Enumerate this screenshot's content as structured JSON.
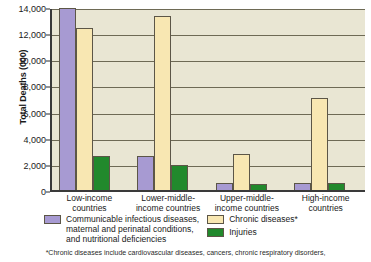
{
  "chart_data": {
    "type": "bar",
    "title": "",
    "xlabel": "",
    "ylabel": "Total Deaths (000)",
    "ylim": [
      0,
      14000
    ],
    "ytick_labels": [
      "14,000",
      "12,000",
      "10,000",
      "8,000",
      "6,000",
      "4,000",
      "2,000",
      "0"
    ],
    "ytick_values": [
      14000,
      12000,
      10000,
      8000,
      6000,
      4000,
      2000,
      0
    ],
    "grid": true,
    "legend_position": "bottom",
    "categories": [
      "Low-income\ncountries",
      "Lower-middle-\nincome countries",
      "Upper-middle-\nincome countries",
      "High-income\ncountries"
    ],
    "series": [
      {
        "name": "Communicable infectious diseases,\nmaternal and perinatal conditions,\nand nutritional deficiencies",
        "color": "#a79ad2",
        "values": [
          13900,
          2600,
          570,
          570
        ]
      },
      {
        "name": "Chronic diseases*",
        "color": "#f8e7b2",
        "values": [
          12400,
          13300,
          2750,
          7050
        ]
      },
      {
        "name": "Injuries",
        "color": "#21892c",
        "values": [
          2600,
          1950,
          450,
          500
        ]
      }
    ],
    "footnote": "*Chronic diseases include cardiovascular diseases, cancers, chronic respiratory disorders,"
  },
  "colors": {
    "plot_background": "#e9e6d3",
    "gridline": "#6e6a55",
    "axis": "#3a3a3a",
    "series_communicable": "#a79ad2",
    "series_chronic": "#f8e7b2",
    "series_injuries": "#21892c"
  }
}
